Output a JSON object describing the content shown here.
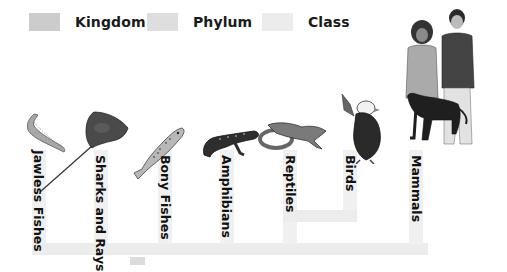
{
  "legend": [
    {
      "label": "Kingdom",
      "color": "#cccccc"
    },
    {
      "label": "Phylum",
      "color": "#dedede"
    },
    {
      "label": "Class",
      "color": "#ececec"
    }
  ],
  "colors": {
    "kingdom": "#cccccc",
    "phylum": "#dedede",
    "class": "#eeeeee",
    "text": "#111111"
  },
  "taxa": [
    {
      "label": "Jawless Fishes",
      "animal": "lamprey-icon"
    },
    {
      "label": "Sharks and Rays",
      "animal": "stingray-icon"
    },
    {
      "label": "Bony Fishes",
      "animal": "trout-icon"
    },
    {
      "label": "Amphibians",
      "animal": "salamander-icon"
    },
    {
      "label": "Reptiles",
      "animal": "snake-and-lizard-icon"
    },
    {
      "label": "Birds",
      "animal": "eagle-icon"
    },
    {
      "label": "Mammals",
      "animal": "people-with-dog-icon"
    }
  ]
}
